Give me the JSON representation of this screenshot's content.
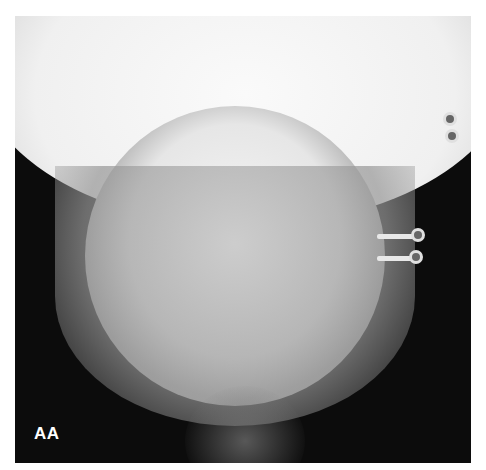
{
  "image": {
    "type": "radiograph",
    "description": "Frontal X-ray of skull/mandible with metal fixation plates and screws on the right side",
    "label": "AA",
    "colors": {
      "background": "#ffffff",
      "film": "#0c0c0c",
      "bone": "#f2f2f2",
      "label_text": "#ffffff"
    }
  }
}
